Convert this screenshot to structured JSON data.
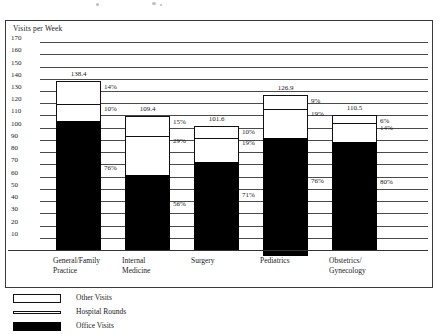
{
  "chart_data": {
    "type": "bar",
    "subtype": "stacked-percentage",
    "title": "",
    "xlabel": "",
    "ylabel": "Visits per Week",
    "ylim": [
      0,
      175
    ],
    "ytick_step": 10,
    "yticks": [
      "170",
      "160",
      "150",
      "140",
      "130",
      "120",
      "110",
      "100",
      "90",
      "80",
      "70",
      "60",
      "50",
      "40",
      "30",
      "20",
      "10"
    ],
    "grid": true,
    "legend_position": "bottom-left",
    "categories": [
      "General/Family Practice",
      "Internal Medicine",
      "Surgery",
      "Pediatrics",
      "Obstetrics/Gynecology"
    ],
    "totals": [
      138.4,
      109.4,
      101.6,
      126.9,
      110.5
    ],
    "total_labels": [
      "138.4",
      "109.4",
      "101.6",
      "126.9",
      "110.5"
    ],
    "series": [
      {
        "name": "Other Visits",
        "key": "other",
        "color": "#ffffff",
        "values": [
          14,
          15,
          10,
          9,
          6
        ],
        "labels": [
          "14%",
          "15%",
          "10%",
          "9%",
          "6%"
        ]
      },
      {
        "name": "Hospital Rounds",
        "key": "hospital",
        "color": "#ffffff",
        "values": [
          10,
          29,
          19,
          19,
          14
        ],
        "labels": [
          "10%",
          "29%",
          "19%",
          "19%",
          "14%"
        ]
      },
      {
        "name": "Office Visits",
        "key": "office",
        "color": "#000000",
        "values": [
          76,
          56,
          71,
          76,
          80
        ],
        "labels": [
          "76%",
          "56%",
          "71%",
          "76%",
          "80%"
        ]
      }
    ]
  },
  "axis": {
    "y_title": "Visits per Week"
  },
  "legend": {
    "items": [
      {
        "label": "Other Visits",
        "swatch": "open-square-swatch"
      },
      {
        "label": "Hospital Rounds",
        "swatch": "thin-bar-swatch"
      },
      {
        "label": "Office Visits",
        "swatch": "filled-square-swatch"
      }
    ]
  },
  "categories_wrapped": [
    [
      "General/Family",
      "Practice"
    ],
    [
      "Internal",
      "Medicine"
    ],
    [
      "Surgery",
      ""
    ],
    [
      "Pediatrics",
      ""
    ],
    [
      "Obstetrics/",
      "Gynecology"
    ]
  ]
}
